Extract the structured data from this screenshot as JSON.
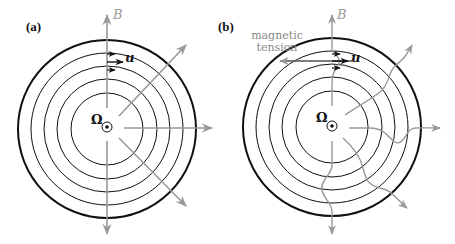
{
  "panels": [
    {
      "label": "(a)",
      "field_label": "B",
      "velocity_label": "u",
      "rotation_label": "Ω",
      "field_lines": "straight radial"
    },
    {
      "label": "(b)",
      "field_label": "B",
      "velocity_label": "u",
      "rotation_label": "Ω",
      "annotation": [
        "magnetic",
        "tension"
      ],
      "field_lines": "wound / kinked radial"
    }
  ],
  "colors": {
    "circles": "#111111",
    "field_lines": "#999999",
    "labels_gray": "#888888"
  }
}
